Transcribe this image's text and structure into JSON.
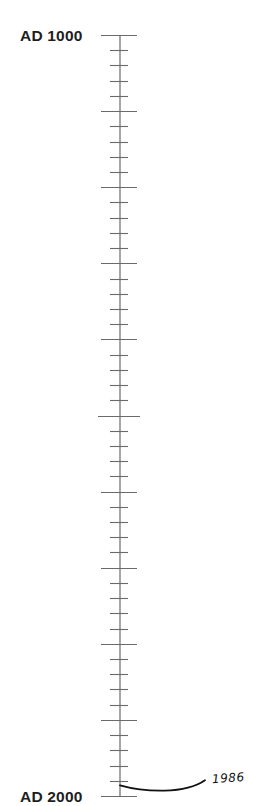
{
  "timeline": {
    "start_label": "AD 1000",
    "end_label": "AD 2000",
    "start_year": 1000,
    "end_year": 2000,
    "minor_tick_interval_years": 20,
    "major_tick_interval_years": 100,
    "axis_color": "#6a6a6a",
    "text_color": "#1e1e1e"
  },
  "annotation": {
    "year": 1986,
    "label": "1986",
    "color": "#111111"
  }
}
